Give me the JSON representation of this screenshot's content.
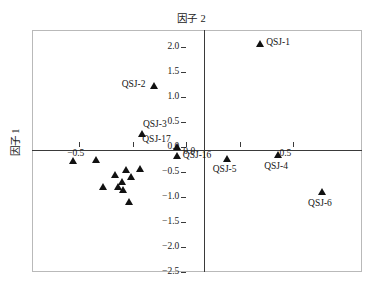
{
  "chart_data": {
    "type": "scatter",
    "title": "因子 2",
    "xlabel": "因子 2",
    "ylabel": "因子 1",
    "xlim": [
      -0.72,
      0.82
    ],
    "ylim": [
      -2.5,
      2.35
    ],
    "grid": false,
    "legend": "none",
    "xticks": [
      {
        "value": -0.5,
        "label": "−0.5"
      },
      {
        "value": 0.0,
        "label": "0.0"
      },
      {
        "value": 0.5,
        "label": "0.5"
      }
    ],
    "xticks_unlabeled": [
      -0.25,
      0.25
    ],
    "yticks": [
      {
        "value": 2.0,
        "label": "2.0"
      },
      {
        "value": 1.5,
        "label": "1.5"
      },
      {
        "value": 1.0,
        "label": "1.0"
      },
      {
        "value": 0.5,
        "label": "0.5"
      },
      {
        "value": 0.0,
        "label": "0.0"
      },
      {
        "value": -0.5,
        "label": "−0.5"
      },
      {
        "value": -1.0,
        "label": "−1.0"
      },
      {
        "value": -1.5,
        "label": "−1.5"
      },
      {
        "value": -2.0,
        "label": "−2.0"
      },
      {
        "value": -2.5,
        "label": "−2.5"
      }
    ],
    "points": [
      {
        "name": "QSJ-1",
        "x": 0.345,
        "y": 2.08,
        "label": "QSJ-1",
        "label_pos": "right"
      },
      {
        "name": "QSJ-2",
        "x": -0.15,
        "y": 1.24,
        "label": "QSJ-2",
        "label_pos": "left"
      },
      {
        "name": "QSJ-3",
        "x": -0.207,
        "y": 0.28,
        "label": "QSJ-3",
        "label_pos": "upright"
      },
      {
        "name": "QSJ-17",
        "x": -0.044,
        "y": 0.02,
        "label": "QSJ-17",
        "label_pos": "upleft"
      },
      {
        "name": "QSJ-16",
        "x": -0.044,
        "y": -0.17,
        "label": "QSJ-16",
        "label_pos": "right"
      },
      {
        "name": "QSJ-5",
        "x": 0.19,
        "y": -0.22,
        "label": "QSJ-5",
        "label_pos": "below"
      },
      {
        "name": "QSJ-4",
        "x": 0.43,
        "y": -0.15,
        "label": "QSJ-4",
        "label_pos": "below"
      },
      {
        "name": "QSJ-6",
        "x": 0.635,
        "y": -0.9,
        "label": "QSJ-6",
        "label_pos": "below"
      },
      {
        "name": "p9",
        "x": -0.53,
        "y": -0.26,
        "label": "",
        "label_pos": ""
      },
      {
        "name": "p10",
        "x": -0.42,
        "y": -0.25,
        "label": "",
        "label_pos": ""
      },
      {
        "name": "p11",
        "x": -0.28,
        "y": -0.44,
        "label": "",
        "label_pos": ""
      },
      {
        "name": "p12",
        "x": -0.33,
        "y": -0.55,
        "label": "",
        "label_pos": ""
      },
      {
        "name": "p13",
        "x": -0.258,
        "y": -0.6,
        "label": "",
        "label_pos": ""
      },
      {
        "name": "p14",
        "x": -0.215,
        "y": -0.42,
        "label": "",
        "label_pos": ""
      },
      {
        "name": "p15",
        "x": -0.386,
        "y": -0.79,
        "label": "",
        "label_pos": ""
      },
      {
        "name": "p16",
        "x": -0.318,
        "y": -0.8,
        "label": "",
        "label_pos": ""
      },
      {
        "name": "p17",
        "x": -0.3,
        "y": -0.7,
        "label": "",
        "label_pos": ""
      },
      {
        "name": "p18",
        "x": -0.296,
        "y": -0.85,
        "label": "",
        "label_pos": ""
      },
      {
        "name": "p19",
        "x": -0.268,
        "y": -1.09,
        "label": "",
        "label_pos": ""
      }
    ]
  },
  "colors": {
    "marker": "#111111",
    "axis": "#3a3a3a",
    "frame": "#b9b9b9",
    "text": "#1a1a1a"
  }
}
